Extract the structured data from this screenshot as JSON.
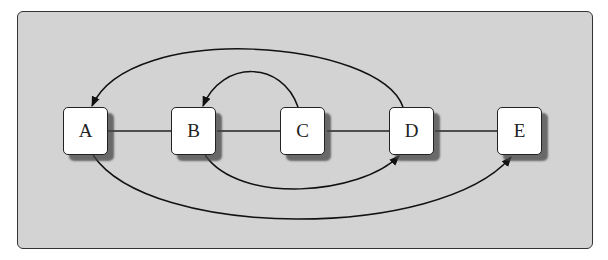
{
  "diagram": {
    "type": "arc-diagram",
    "background_color": "#d3d3d3",
    "nodes": [
      {
        "id": "A",
        "label": "A"
      },
      {
        "id": "B",
        "label": "B"
      },
      {
        "id": "C",
        "label": "C"
      },
      {
        "id": "D",
        "label": "D"
      },
      {
        "id": "E",
        "label": "E"
      }
    ],
    "sequence_links": [
      {
        "from": "A",
        "to": "B"
      },
      {
        "from": "B",
        "to": "C"
      },
      {
        "from": "C",
        "to": "D"
      },
      {
        "from": "D",
        "to": "E"
      }
    ],
    "arcs": [
      {
        "from": "D",
        "to": "A",
        "side": "top",
        "directed": true
      },
      {
        "from": "C",
        "to": "B",
        "side": "top",
        "directed": true
      },
      {
        "from": "B",
        "to": "D",
        "side": "bottom",
        "directed": true
      },
      {
        "from": "A",
        "to": "E",
        "side": "bottom",
        "directed": true
      }
    ]
  }
}
